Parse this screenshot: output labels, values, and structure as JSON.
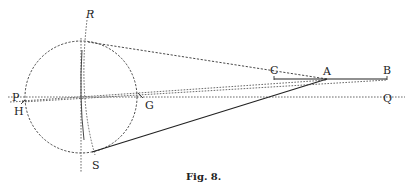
{
  "figure": {
    "caption": "Fig. 8.",
    "labels": {
      "P": "P",
      "H": "H",
      "R": "R",
      "S": "S",
      "G": "G",
      "C": "C",
      "A": "A",
      "B": "B",
      "Q": "Q"
    },
    "elements": [
      "dashed circle",
      "horizontal dashed axis P–Q",
      "dashed arc R–S (vertical curve through circle)",
      "vertical dashed line through circle center",
      "dashed line from top of circle to A",
      "solid line from S to A",
      "solid segment C–B",
      "dashed lines from H through G toward A/B"
    ]
  }
}
